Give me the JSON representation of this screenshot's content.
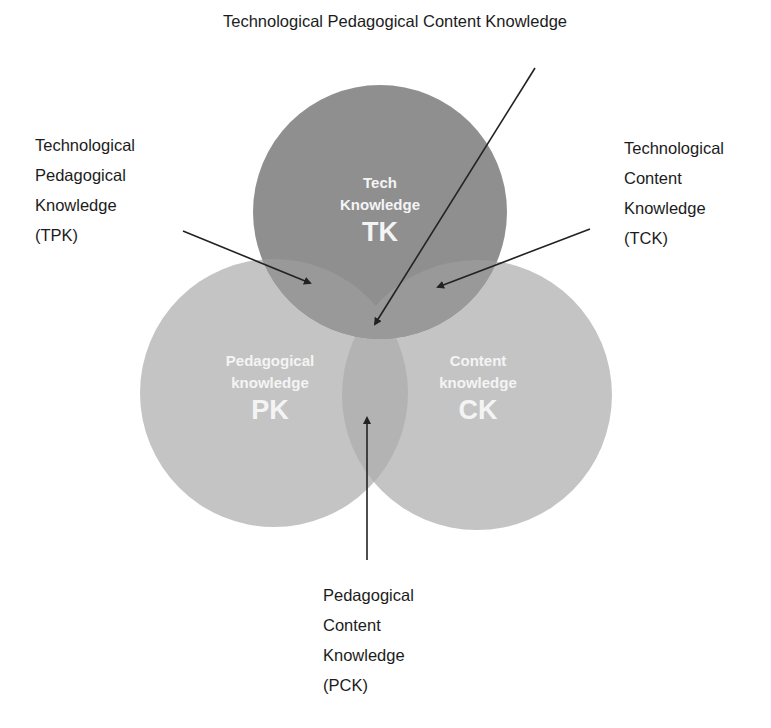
{
  "title": "Technological Pedagogical Content Knowledge",
  "circles": {
    "tk": {
      "line1": "Tech",
      "line2": "Knowledge",
      "abbr": "TK",
      "color": "#8f8f8f"
    },
    "pk": {
      "line1": "Pedagogical",
      "line2": "knowledge",
      "abbr": "PK",
      "color": "#c4c4c4"
    },
    "ck": {
      "line1": "Content",
      "line2": "knowledge",
      "abbr": "CK",
      "color": "#c4c4c4"
    }
  },
  "labels": {
    "tpk": [
      "Technological",
      "Pedagogical",
      "Knowledge",
      "(TPK)"
    ],
    "tck": [
      "Technological",
      "Content",
      "Knowledge",
      "(TCK)"
    ],
    "pck": [
      "Pedagogical",
      "Content",
      "Knowledge",
      "(PCK)"
    ]
  },
  "colors": {
    "background": "#ffffff",
    "tk_fill": "#8f8f8f",
    "outer_fill": "#c4c4c4",
    "overlap_fill": "#a9a9a9",
    "arrow": "#222222",
    "inner_text": "#f4f4f4"
  }
}
